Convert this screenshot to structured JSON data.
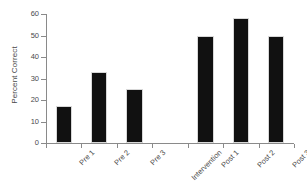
{
  "chart_data": {
    "type": "bar",
    "title": "",
    "subtitle": "",
    "xlabel": "",
    "ylabel": "Percent Correct",
    "categories": [
      "Pre 1",
      "Pre 2",
      "Pre 3",
      "Intervention",
      "Post 1",
      "Post 2",
      "Post 3"
    ],
    "values": [
      17,
      33,
      25,
      0,
      50,
      58,
      50
    ],
    "ylim": [
      0,
      60
    ],
    "yticks": [
      0,
      10,
      20,
      30,
      40,
      50,
      60
    ],
    "ytick_labels": [
      "0",
      "10",
      "20",
      "30",
      "40",
      "50",
      "60"
    ],
    "grid": false,
    "legend": null,
    "bar_color": "#111111",
    "axis_color": "#8a8a8a",
    "text_color": "#4a4a4a",
    "background": "#ffffff"
  }
}
